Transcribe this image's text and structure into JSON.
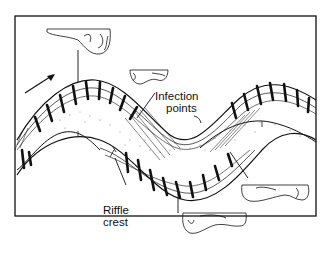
{
  "diagram": {
    "type": "meandering river channel schematic",
    "labels": {
      "infection_line1": "Infection",
      "infection_line2": "points",
      "riffle_line1": "Riffle",
      "riffle_line2": "crest"
    },
    "elements": [
      "meander-channel",
      "flow-direction-arrow",
      "cross-section-insets",
      "secondary-flow-circulation-cells",
      "point-bar-stipple"
    ],
    "colors": {
      "ink": "#111111",
      "background": "#ffffff"
    }
  }
}
